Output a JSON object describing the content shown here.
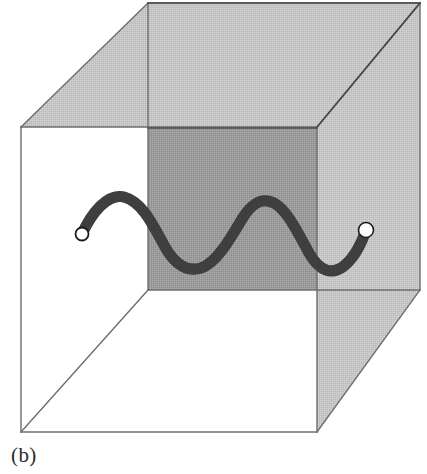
{
  "figure": {
    "caption": "(b)",
    "canvas": {
      "width": 427,
      "height": 474
    },
    "colors": {
      "background": "#ffffff",
      "edge_line": "#6e6e6e",
      "edge_line_dark": "#4a4a4a",
      "face_light_gray": "#c8c8c8",
      "face_mid_gray": "#9a9a9a",
      "filament": "#2e2e2e",
      "endpoint_fill": "#ffffff",
      "endpoint_stroke": "#1c1c1c",
      "caption_text": "#2b2b2b"
    },
    "box": {
      "name": "cube",
      "front_face": {
        "label": "front-face",
        "shaded": false,
        "corners": [
          [
            21,
            127
          ],
          [
            317,
            127
          ],
          [
            317,
            432
          ],
          [
            21,
            432
          ]
        ]
      },
      "back_face": {
        "label": "back-face",
        "shaded": true,
        "shade": "light",
        "corners": [
          [
            148,
            3
          ],
          [
            420,
            3
          ],
          [
            420,
            290
          ],
          [
            148,
            290
          ]
        ]
      },
      "top_face": {
        "label": "top-face",
        "shaded": true,
        "shade": "light",
        "corners": [
          [
            21,
            127
          ],
          [
            148,
            3
          ],
          [
            420,
            3
          ],
          [
            317,
            127
          ]
        ]
      },
      "right_face": {
        "label": "right-face",
        "shaded": true,
        "shade": "light",
        "corners": [
          [
            317,
            127
          ],
          [
            420,
            3
          ],
          [
            420,
            290
          ],
          [
            317,
            432
          ]
        ]
      },
      "left_face": {
        "label": "left-face",
        "shaded": false,
        "corners": [
          [
            21,
            127
          ],
          [
            148,
            3
          ],
          [
            148,
            290
          ],
          [
            21,
            432
          ]
        ]
      },
      "bottom_face": {
        "label": "bottom-face",
        "shaded": false,
        "corners": [
          [
            21,
            432
          ],
          [
            148,
            290
          ],
          [
            420,
            290
          ],
          [
            317,
            432
          ]
        ]
      },
      "overlap_panel": {
        "label": "inner-shaded-plane",
        "shade": "mid",
        "corners": [
          [
            148,
            128
          ],
          [
            317,
            128
          ],
          [
            317,
            290
          ],
          [
            148,
            290
          ]
        ]
      }
    },
    "filament": {
      "label": "sinusoidal-chain",
      "stroke_width": 11,
      "path_points": [
        [
          82,
          234
        ],
        [
          92,
          218
        ],
        [
          104,
          203
        ],
        [
          118,
          197
        ],
        [
          133,
          202
        ],
        [
          148,
          215
        ],
        [
          162,
          238
        ],
        [
          176,
          258
        ],
        [
          190,
          268
        ],
        [
          205,
          266
        ],
        [
          220,
          252
        ],
        [
          234,
          231
        ],
        [
          248,
          211
        ],
        [
          260,
          200
        ],
        [
          272,
          201
        ],
        [
          285,
          212
        ],
        [
          298,
          235
        ],
        [
          311,
          258
        ],
        [
          324,
          270
        ],
        [
          338,
          269
        ],
        [
          350,
          256
        ],
        [
          360,
          241
        ],
        [
          366,
          230
        ]
      ],
      "endpoints": [
        {
          "label": "left-endpoint",
          "cx": 82,
          "cy": 234,
          "r": 7
        },
        {
          "label": "right-endpoint",
          "cx": 366,
          "cy": 230,
          "r": 8
        }
      ]
    }
  }
}
